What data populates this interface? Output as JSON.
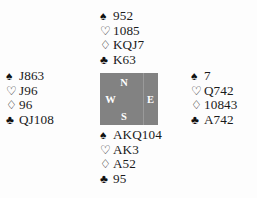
{
  "diagram": {
    "compass": {
      "north_label": "N",
      "west_label": "W",
      "east_label": "E",
      "south_label": "S",
      "box_color": "#828282",
      "label_color": "#ffffff"
    },
    "suit_symbols": {
      "spade": "♠",
      "heart": "♡",
      "diamond": "♢",
      "club": "♣"
    },
    "hands": {
      "north": {
        "seat": "North",
        "spades": "952",
        "hearts": "1085",
        "diamonds": "KQJ7",
        "clubs": "K63"
      },
      "west": {
        "seat": "West",
        "spades": "J863",
        "hearts": "J96",
        "diamonds": "96",
        "clubs": "QJ108"
      },
      "east": {
        "seat": "East",
        "spades": "7",
        "hearts": "Q742",
        "diamonds": "10843",
        "clubs": "A742"
      },
      "south": {
        "seat": "South",
        "spades": "AKQ104",
        "hearts": "AK3",
        "diamonds": "A52",
        "clubs": "95"
      }
    }
  }
}
